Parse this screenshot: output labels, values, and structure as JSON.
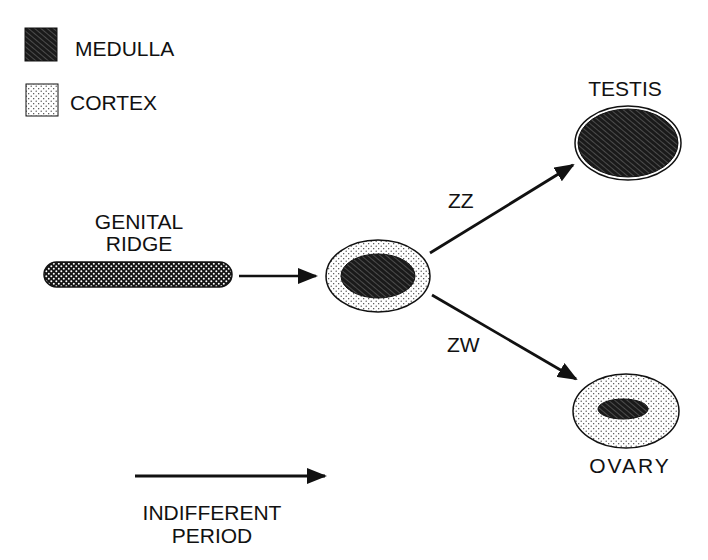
{
  "legend": {
    "items": [
      {
        "label": "MEDULLA",
        "pattern": "hatched",
        "color": "#1a1a1a"
      },
      {
        "label": "CORTEX",
        "pattern": "stippled",
        "color": "#ffffff"
      }
    ]
  },
  "stages": {
    "genital_ridge": {
      "label_line1": "GENITAL",
      "label_line2": "RIDGE"
    },
    "indifferent_gonad": {
      "label": ""
    },
    "testis": {
      "label": "TESTIS"
    },
    "ovary": {
      "label": "OVARY"
    }
  },
  "arrows": {
    "ridge_to_gonad": {
      "label": ""
    },
    "to_testis": {
      "label": "ZZ"
    },
    "to_ovary": {
      "label": "ZW"
    }
  },
  "timeline": {
    "label_line1": "INDIFFERENT",
    "label_line2": "PERIOD"
  },
  "colors": {
    "ink": "#111111",
    "medulla_fill": "#1a1a1a",
    "cortex_fill": "#ffffff",
    "background": "#ffffff"
  }
}
